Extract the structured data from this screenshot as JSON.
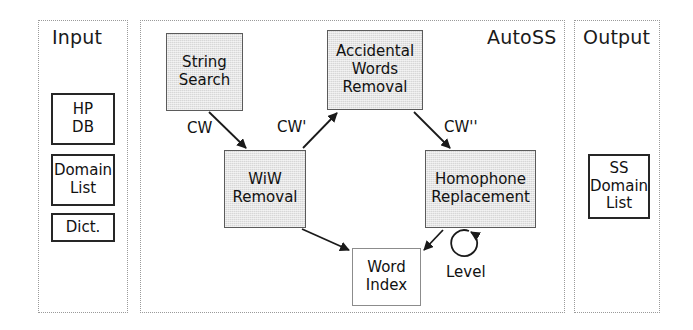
{
  "diagram": {
    "title_visible": false,
    "panels": [
      {
        "id": "input",
        "label": "Input"
      },
      {
        "id": "autoss",
        "label": "AutoSS"
      },
      {
        "id": "output",
        "label": "Output"
      }
    ],
    "input_nodes": [
      {
        "id": "hp-db",
        "label": "HP\nDB"
      },
      {
        "id": "domain-list",
        "label": "Domain\nList"
      },
      {
        "id": "dict",
        "label": "Dict."
      }
    ],
    "process_nodes": [
      {
        "id": "string-search",
        "label": "String\nSearch"
      },
      {
        "id": "accidental-words-removal",
        "label": "Accidental\nWords\nRemoval"
      },
      {
        "id": "wiw-removal",
        "label": "WiW\nRemoval"
      },
      {
        "id": "homophone-replacement",
        "label": "Homophone\nReplacement"
      }
    ],
    "data_nodes": [
      {
        "id": "word-index",
        "label": "Word\nIndex"
      }
    ],
    "output_nodes": [
      {
        "id": "ss-domain-list",
        "label": "SS\nDomain\nList"
      }
    ],
    "edge_labels": [
      {
        "id": "cw",
        "label": "CW"
      },
      {
        "id": "cw1",
        "label": "CW'"
      },
      {
        "id": "cw2",
        "label": "CW''"
      },
      {
        "id": "level",
        "label": "Level"
      }
    ],
    "colors": {
      "process_fill": "#d7d7d7",
      "process_stroke": "#5b5b5b",
      "io_stroke": "#262626",
      "panel_stroke": "#9a9a9a",
      "edge_stroke": "#1a1a1a",
      "text": "#111111",
      "background": "#ffffff"
    }
  }
}
